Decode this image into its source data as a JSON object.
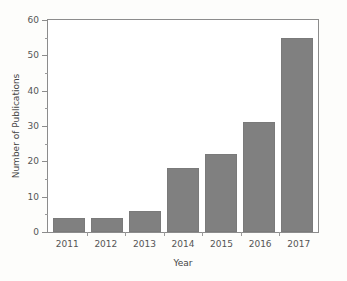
{
  "chart_data": {
    "type": "bar",
    "title": "",
    "xlabel": "Year",
    "ylabel": "Number of Publications",
    "categories": [
      "2011",
      "2012",
      "2013",
      "2014",
      "2015",
      "2016",
      "2017"
    ],
    "values": [
      4,
      4,
      6,
      18,
      22,
      31,
      55
    ],
    "ylim": [
      0,
      60
    ],
    "y_major_ticks": [
      0,
      10,
      20,
      30,
      40,
      50,
      60
    ],
    "y_minor_ticks": [
      5,
      15,
      25,
      35,
      45,
      55
    ],
    "y_tick_labels": [
      "0",
      "10",
      "20",
      "30",
      "40",
      "50",
      "60"
    ],
    "grid": false,
    "legend": null,
    "bar_color": "#808080",
    "plot_background": "#ffffff",
    "figure_background": "#fdfdfb",
    "axis_color": "#8c8c8c"
  }
}
